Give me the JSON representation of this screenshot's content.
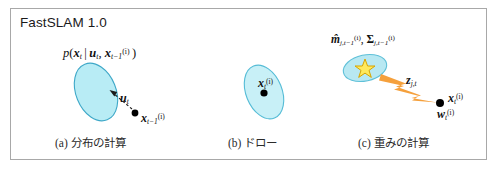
{
  "figure": {
    "title": "FastSLAM 1.0",
    "border_color": "#a8a8a8",
    "background": "#ffffff"
  },
  "panels": [
    {
      "id": "a",
      "caption": "(a) 分布の計算",
      "ellipse": {
        "fill": "#b8ecf5",
        "stroke": "#3ea8c8",
        "cx": 96,
        "cy": 92,
        "rx": 20,
        "ry": 30,
        "rotation_deg": -22
      },
      "formula_label": "p(x_t | u_t, x_{t-1}^{(i)})",
      "vector_label": "u_t",
      "point_label": "x_{t-1}^{(i)}",
      "point": {
        "x": 135,
        "y": 113,
        "r": 3.4,
        "color": "#000000"
      },
      "arrow": {
        "style": "dashed",
        "from_x": 133,
        "from_y": 109,
        "to_x": 110,
        "to_y": 91
      }
    },
    {
      "id": "b",
      "caption": "(b) ドロー",
      "ellipse": {
        "fill": "#c8f0f7",
        "stroke": "#55bcd6",
        "cx": 264,
        "cy": 92,
        "rx": 18,
        "ry": 28,
        "rotation_deg": -22
      },
      "point_label": "x_t^{(i)}",
      "point": {
        "x": 264,
        "y": 92,
        "r": 3.6,
        "color": "#000000"
      }
    },
    {
      "id": "c",
      "caption": "(c) 重みの計算",
      "ellipse": {
        "fill": "#b8e8f2",
        "stroke": "#5fc0d8",
        "cx": 365,
        "cy": 68,
        "rx": 22,
        "ry": 13,
        "rotation_deg": -12
      },
      "star": {
        "cx": 365,
        "cy": 69,
        "r": 10,
        "fill": "#ffe95c",
        "stroke": "#d8a400"
      },
      "landmark_label": "m̂_{j,t-1}^{(i)}, Σ_{j,t-1}^{(i)}",
      "measurement_label": "z_{j,t}",
      "pose_label": "x_t^{(i)}",
      "weight_label": "w_t^{(i)}",
      "point": {
        "x": 440,
        "y": 103,
        "r": 4.0,
        "color": "#000000"
      },
      "bolt": {
        "color": "#f5a03c",
        "from_x": 382,
        "from_y": 78,
        "to_x": 437,
        "to_y": 102
      }
    }
  ],
  "colors": {
    "ellipse_fill": "#b8ecf5",
    "ellipse_stroke": "#3ea8c8",
    "star_fill": "#ffe95c",
    "star_stroke": "#d8a400",
    "bolt": "#f5a03c",
    "text": "#111111",
    "border": "#a8a8a8"
  }
}
